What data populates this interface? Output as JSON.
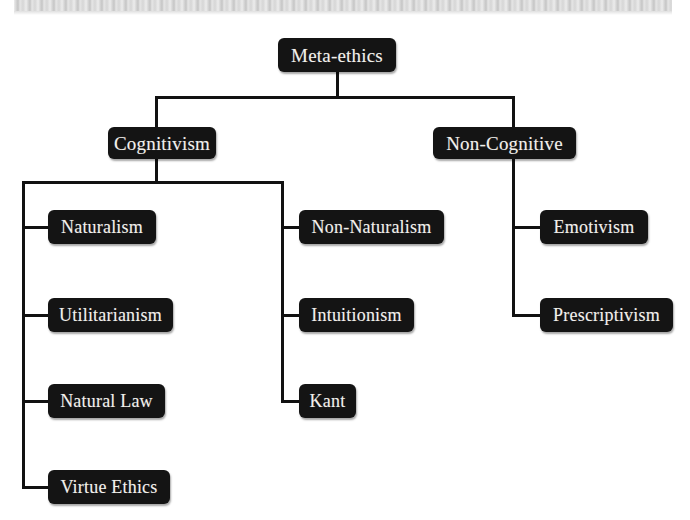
{
  "diagram": {
    "type": "tree",
    "title": "Meta-ethics",
    "background_color": "#ffffff",
    "node_color": "#141414",
    "node_text_color": "#f2f0ec",
    "line_color": "#111111",
    "scan_band_color": "#d4d4d4"
  },
  "nodes": {
    "root": {
      "label": "Meta-ethics"
    },
    "level1": [
      {
        "label": "Cognitivism"
      },
      {
        "label": "Non-Cognitive"
      }
    ],
    "cognitivism_left": [
      {
        "label": "Naturalism"
      },
      {
        "label": "Utilitarianism"
      },
      {
        "label": "Natural Law"
      },
      {
        "label": "Virtue Ethics"
      }
    ],
    "cognitivism_right": [
      {
        "label": "Non-Naturalism"
      },
      {
        "label": "Intuitionism"
      },
      {
        "label": "Kant"
      }
    ],
    "noncognitive_children": [
      {
        "label": "Emotivism"
      },
      {
        "label": "Prescriptivism"
      }
    ]
  }
}
